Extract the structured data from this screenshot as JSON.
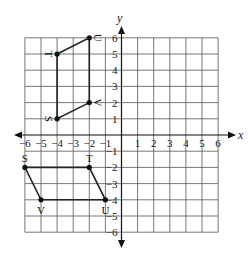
{
  "diagram": {
    "type": "coordinate-plane",
    "x_axis_label": "x",
    "y_axis_label": "y",
    "x_range": [
      -6,
      6
    ],
    "y_range": [
      -6,
      6
    ],
    "x_ticks": [
      "-6",
      "-5",
      "-4",
      "-3",
      "-2",
      "-1",
      "1",
      "2",
      "3",
      "4",
      "5",
      "6"
    ],
    "y_ticks": [
      "6",
      "5",
      "4",
      "3",
      "2",
      "1",
      "-1",
      "-2",
      "-3",
      "-4",
      "-5",
      "-6"
    ],
    "figures": [
      {
        "name": "upper-parallelogram",
        "vertices": [
          {
            "label": "S",
            "x": -4,
            "y": 1
          },
          {
            "label": "T",
            "x": -4,
            "y": 5
          },
          {
            "label": "U",
            "x": -2,
            "y": 6
          },
          {
            "label": "V",
            "x": -2,
            "y": 2
          }
        ],
        "labels_rotated": true
      },
      {
        "name": "lower-parallelogram",
        "vertices": [
          {
            "label": "S",
            "x": -6,
            "y": -2
          },
          {
            "label": "T",
            "x": -2,
            "y": -2
          },
          {
            "label": "U",
            "x": -1,
            "y": -4
          },
          {
            "label": "V",
            "x": -5,
            "y": -4
          }
        ],
        "labels_rotated": false
      }
    ]
  }
}
